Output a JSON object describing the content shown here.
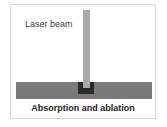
{
  "diagram": {
    "beam_label": "Laser beam",
    "caption": "Absorption and ablation",
    "colors": {
      "beam": "#a8a8a8",
      "substrate": "#7a7a7a",
      "ablation_well": "#2a2a2a",
      "frame_border": "#d8d8d8"
    }
  }
}
